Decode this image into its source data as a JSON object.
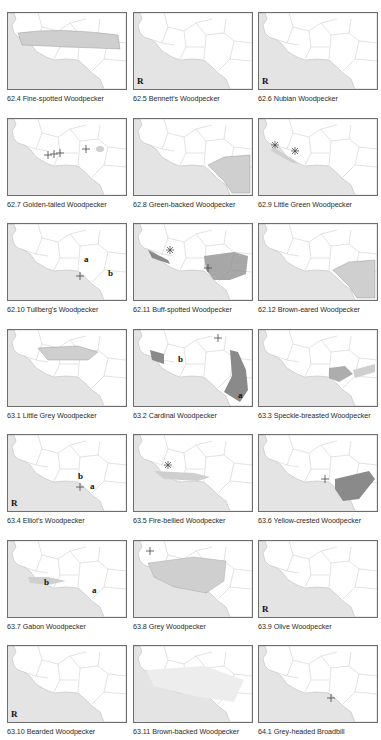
{
  "page": {
    "layout": "3-column grid of range maps (West Africa)",
    "colors": {
      "ocean": "#e4e4e4",
      "land": "#ffffff",
      "border": "#bcbcbc",
      "range_light": "#cfcfcf",
      "range_dark": "#8a8a8a",
      "frame": "#6e6e6e"
    }
  },
  "maps": [
    {
      "caption": "62.4 Fine-spotted Woodpecker",
      "range": "sahel-band",
      "labels": []
    },
    {
      "caption": "62.5 Bennett's Woodpecker",
      "range": "none",
      "labels": [
        "R"
      ]
    },
    {
      "caption": "62.6 Nubian Woodpecker",
      "range": "none",
      "labels": [
        "R"
      ]
    },
    {
      "caption": "62.7 Golden-tailed Woodpecker",
      "range": "crosses-west",
      "labels": []
    },
    {
      "caption": "62.8 Green-backed Woodpecker",
      "range": "southeast-light",
      "labels": []
    },
    {
      "caption": "62.9 Little Green Woodpecker",
      "range": "west-coast-asterisks",
      "labels": []
    },
    {
      "caption": "62.10 Tullberg's Woodpecker",
      "range": "crosses-cameroon",
      "labels": [
        "a",
        "b"
      ]
    },
    {
      "caption": "62.11 Buff-spotted Woodpecker",
      "range": "west-coast-and-southeast-dark",
      "labels": []
    },
    {
      "caption": "62.12 Brown-eared Woodpecker",
      "range": "southeast-light",
      "labels": []
    },
    {
      "caption": "63.1 Little Grey Woodpecker",
      "range": "central-sahel",
      "labels": []
    },
    {
      "caption": "63.2 Cardinal Woodpecker",
      "range": "patches",
      "labels": [
        "b",
        "a"
      ]
    },
    {
      "caption": "63.3 Speckle-breasted Woodpecker",
      "range": "east-patch",
      "labels": []
    },
    {
      "caption": "63.4 Elliot's Woodpecker",
      "range": "crosses-cameroon",
      "labels": [
        "b",
        "a",
        "R"
      ]
    },
    {
      "caption": "63.5 Fire-bellied Woodpecker",
      "range": "guinea-coast",
      "labels": []
    },
    {
      "caption": "63.6 Yellow-crested Woodpecker",
      "range": "southeast-dark",
      "labels": []
    },
    {
      "caption": "63.7 Gabon Woodpecker",
      "range": "coast-light",
      "labels": [
        "b",
        "a"
      ]
    },
    {
      "caption": "63.8 Grey Woodpecker",
      "range": "wide-light",
      "labels": []
    },
    {
      "caption": "63.9 Olive Woodpecker",
      "range": "none",
      "labels": [
        "R"
      ]
    },
    {
      "caption": "63.10 Bearded Woodpecker",
      "range": "none",
      "labels": [
        "R"
      ]
    },
    {
      "caption": "63.11 Brown-backed Woodpecker",
      "range": "wide-faint",
      "labels": []
    },
    {
      "caption": "64.1 Grey-headed Broadbill",
      "range": "crosses-cameroon",
      "labels": []
    }
  ]
}
